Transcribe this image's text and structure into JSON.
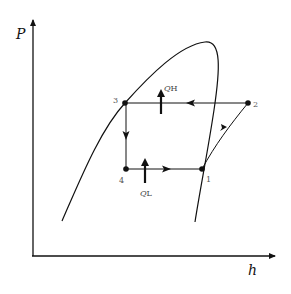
{
  "diagram": {
    "type": "P-h diagram (vapor-compression refrigeration cycle)",
    "axes": {
      "y_label": "P",
      "x_label": "h"
    },
    "points": [
      {
        "id": "1",
        "label": "1",
        "x": 202,
        "y": 169
      },
      {
        "id": "2",
        "label": "2",
        "x": 248,
        "y": 103
      },
      {
        "id": "3",
        "label": "3",
        "x": 125,
        "y": 103
      },
      {
        "id": "4",
        "label": "4",
        "x": 126,
        "y": 169
      }
    ],
    "heat_labels": {
      "high": {
        "q": "Q",
        "sub": "H"
      },
      "low": {
        "q": "Q",
        "sub": "L"
      }
    },
    "colors": {
      "line": "#111111",
      "label": "#555555"
    }
  }
}
